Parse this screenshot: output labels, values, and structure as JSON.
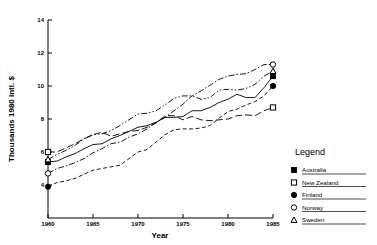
{
  "chart_data": {
    "type": "line",
    "title": "",
    "xlabel": "Year",
    "ylabel": "Thousands 1980 Intl. $",
    "xlim": [
      1960,
      1985
    ],
    "ylim": [
      2,
      14
    ],
    "xticks": [
      1960,
      1965,
      1970,
      1975,
      1980,
      1985
    ],
    "yticks": [
      4,
      6,
      8,
      10,
      12,
      14
    ],
    "xtick_labels": [
      "1960",
      "1965",
      "1970",
      "1975",
      "1980",
      "1985"
    ],
    "ytick_labels": [
      "4",
      "6",
      "8",
      "10",
      "12",
      "14"
    ],
    "grid": false,
    "legend_position": "right",
    "x": [
      1960,
      1961,
      1962,
      1963,
      1964,
      1965,
      1966,
      1967,
      1968,
      1969,
      1970,
      1971,
      1972,
      1973,
      1974,
      1975,
      1976,
      1977,
      1978,
      1979,
      1980,
      1981,
      1982,
      1983,
      1984,
      1985
    ],
    "series": [
      {
        "name": "Australia",
        "marker": "filled-square",
        "line_style": "solid",
        "endpoint_start": 5.4,
        "endpoint_end": 10.6,
        "values": [
          5.4,
          5.45,
          5.7,
          5.9,
          6.2,
          6.45,
          6.5,
          6.8,
          7.0,
          7.25,
          7.5,
          7.6,
          7.8,
          8.1,
          8.1,
          8.15,
          8.5,
          8.5,
          8.7,
          9.0,
          9.2,
          9.5,
          9.3,
          9.3,
          9.9,
          10.6
        ]
      },
      {
        "name": "New Zealand",
        "marker": "open-square",
        "line_style": "long-dash",
        "endpoint_start": 6.0,
        "endpoint_end": 8.7,
        "values": [
          6.0,
          6.0,
          6.25,
          6.5,
          6.8,
          7.05,
          7.2,
          6.95,
          7.1,
          7.25,
          7.3,
          7.5,
          7.75,
          8.2,
          8.2,
          7.95,
          8.15,
          7.95,
          7.9,
          7.95,
          8.0,
          8.2,
          8.25,
          8.2,
          8.5,
          8.7
        ]
      },
      {
        "name": "Finland",
        "marker": "filled-circle",
        "line_style": "dashed",
        "endpoint_start": 3.9,
        "endpoint_end": 10.0,
        "values": [
          3.9,
          4.15,
          4.25,
          4.4,
          4.65,
          4.9,
          5.0,
          5.1,
          5.2,
          5.6,
          6.0,
          6.15,
          6.6,
          7.05,
          7.35,
          7.4,
          7.4,
          7.45,
          7.6,
          8.05,
          8.45,
          8.6,
          8.85,
          9.05,
          9.4,
          10.0
        ]
      },
      {
        "name": "Norway",
        "marker": "open-circle",
        "line_style": "dash-dot",
        "endpoint_start": 4.7,
        "endpoint_end": 11.3,
        "values": [
          4.7,
          5.0,
          5.15,
          5.35,
          5.6,
          5.95,
          6.2,
          6.5,
          6.6,
          6.9,
          7.1,
          7.4,
          7.8,
          8.1,
          8.5,
          8.9,
          9.4,
          9.7,
          10.05,
          10.4,
          10.6,
          10.7,
          10.75,
          11.0,
          11.3,
          11.3
        ]
      },
      {
        "name": "Sweden",
        "marker": "open-triangle",
        "line_style": "dash-dot-dot",
        "endpoint_start": 5.55,
        "endpoint_end": 10.9,
        "values": [
          5.55,
          5.85,
          6.1,
          6.4,
          6.8,
          7.05,
          7.1,
          7.3,
          7.6,
          7.95,
          8.3,
          8.35,
          8.5,
          8.85,
          9.25,
          9.4,
          9.4,
          9.2,
          9.3,
          9.75,
          9.8,
          9.75,
          9.85,
          10.1,
          10.6,
          10.9
        ]
      }
    ]
  },
  "legend": {
    "title": "Legend",
    "items": [
      {
        "label": "Australia",
        "marker": "filled-square"
      },
      {
        "label": "New Zealand",
        "marker": "open-square"
      },
      {
        "label": "Finland",
        "marker": "filled-circle"
      },
      {
        "label": "Norway",
        "marker": "open-circle"
      },
      {
        "label": "Sweden",
        "marker": "open-triangle"
      }
    ]
  }
}
